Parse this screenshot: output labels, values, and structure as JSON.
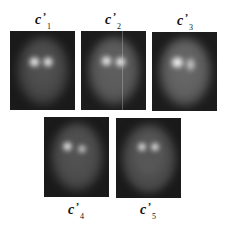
{
  "figure": {
    "panels": [
      {
        "id": "c1",
        "label": {
          "base": "c",
          "prime": "’",
          "sub": "1"
        },
        "colors": {
          "background": "#1a1a1a",
          "head": "#4a4a4a",
          "spot": "#f0f0f0"
        }
      },
      {
        "id": "c2",
        "label": {
          "base": "c",
          "prime": "’",
          "sub": "2"
        },
        "colors": {
          "background": "#1c1c1c",
          "head": "#5a5a5a",
          "spot": "#f0f0f0"
        }
      },
      {
        "id": "c3",
        "label": {
          "base": "c",
          "prime": "’",
          "sub": "3"
        },
        "colors": {
          "background": "#1c1c1c",
          "head": "#606060",
          "spot": "#f5f5f5"
        }
      },
      {
        "id": "c4",
        "label": {
          "base": "c",
          "prime": "’",
          "sub": "4"
        },
        "colors": {
          "background": "#1a1a1a",
          "head": "#4c4c4c",
          "spot": "#ffffff"
        }
      },
      {
        "id": "c5",
        "label": {
          "base": "c",
          "prime": "’",
          "sub": "5"
        },
        "colors": {
          "background": "#1a1a1a",
          "head": "#555555",
          "spot": "#ffffff"
        }
      }
    ]
  }
}
